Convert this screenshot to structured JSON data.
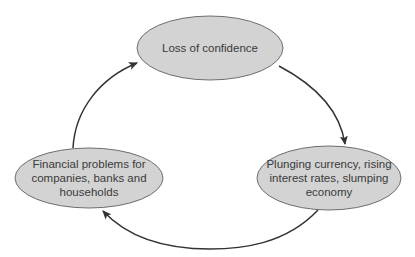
{
  "diagram": {
    "type": "cycle",
    "colors": {
      "node_fill": "#d3d3d3",
      "node_stroke": "#6e6e6e",
      "arrow": "#333333",
      "text": "#3a3a3a",
      "background": "#ffffff"
    },
    "nodes": [
      {
        "id": "loss-of-confidence",
        "lines": [
          "Loss of confidence"
        ]
      },
      {
        "id": "plunging-currency",
        "lines": [
          "Plunging currency, rising",
          "interest rates, slumping",
          "economy"
        ]
      },
      {
        "id": "financial-problems",
        "lines": [
          "Financial problems for",
          "companies, banks and",
          "households"
        ]
      }
    ],
    "edges": [
      {
        "from": "loss-of-confidence",
        "to": "plunging-currency"
      },
      {
        "from": "plunging-currency",
        "to": "financial-problems"
      },
      {
        "from": "financial-problems",
        "to": "loss-of-confidence"
      }
    ]
  }
}
